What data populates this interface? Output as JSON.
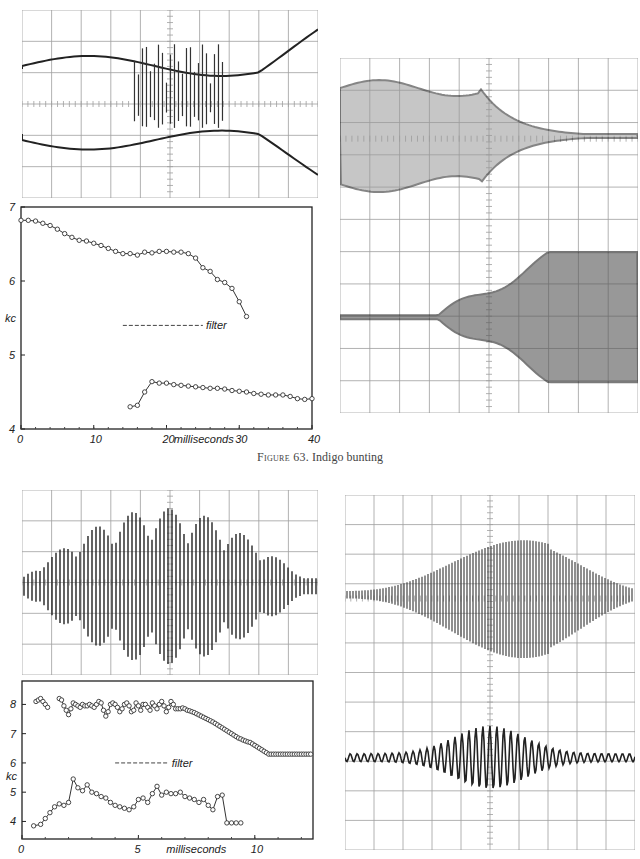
{
  "figure": {
    "caption_label": "Figure 63.",
    "caption_text": " Indigo bunting"
  },
  "oscillograms": [
    {
      "id": "osc-top-left",
      "x": 22,
      "y": 10,
      "w": 296,
      "h": 188,
      "kind": "bowtie-spiky"
    },
    {
      "id": "osc-top-right",
      "x": 340,
      "y": 58,
      "w": 298,
      "h": 355,
      "kind": "envelope-pair"
    },
    {
      "id": "osc-bottom-left",
      "x": 22,
      "y": 490,
      "w": 296,
      "h": 185,
      "kind": "spiky-burst"
    },
    {
      "id": "osc-bottom-right",
      "x": 345,
      "y": 495,
      "w": 290,
      "h": 355,
      "kind": "sinusoid-pair"
    }
  ],
  "chart_data": [
    {
      "type": "line",
      "title": "",
      "xlabel": "milliseconds",
      "ylabel": "kc",
      "xlim": [
        0,
        40
      ],
      "ylim": [
        4,
        7
      ],
      "xticks": [
        "0",
        "10",
        "20",
        "30",
        "40"
      ],
      "yticks": [
        "4",
        "5",
        "6",
        "7"
      ],
      "grid": false,
      "annotation": "filter",
      "box": {
        "x": 21,
        "y": 207,
        "w": 291,
        "h": 222
      },
      "series": [
        {
          "name": "upper",
          "x": [
            0,
            1,
            2,
            3,
            4,
            5,
            6,
            7,
            8,
            9,
            10,
            11,
            12,
            13,
            14,
            15,
            16,
            17,
            18,
            19,
            20,
            21,
            22,
            23,
            24,
            25,
            26,
            27,
            28,
            29,
            30,
            31
          ],
          "y": [
            6.82,
            6.82,
            6.81,
            6.78,
            6.75,
            6.7,
            6.64,
            6.59,
            6.55,
            6.54,
            6.51,
            6.48,
            6.44,
            6.4,
            6.37,
            6.37,
            6.35,
            6.39,
            6.38,
            6.4,
            6.4,
            6.39,
            6.39,
            6.37,
            6.31,
            6.18,
            6.13,
            6.02,
            5.98,
            5.9,
            5.72,
            5.52
          ]
        },
        {
          "name": "lower",
          "x": [
            15,
            16,
            17,
            18,
            19,
            20,
            21,
            22,
            23,
            24,
            25,
            26,
            27,
            28,
            29,
            30,
            31,
            32,
            33,
            34,
            35,
            36,
            37,
            38,
            39,
            40
          ],
          "y": [
            4.3,
            4.32,
            4.5,
            4.64,
            4.62,
            4.62,
            4.6,
            4.59,
            4.58,
            4.57,
            4.56,
            4.55,
            4.55,
            4.54,
            4.52,
            4.51,
            4.5,
            4.48,
            4.47,
            4.46,
            4.46,
            4.46,
            4.44,
            4.41,
            4.4,
            4.41
          ]
        }
      ]
    },
    {
      "type": "line",
      "title": "",
      "xlabel": "milliseconds",
      "ylabel": "kc",
      "xlim": [
        0,
        12.5
      ],
      "ylim": [
        3.4,
        8.8
      ],
      "xticks": [
        "0",
        "5",
        "10"
      ],
      "yticks": [
        "4",
        "5",
        "6",
        "7",
        "8"
      ],
      "grid": false,
      "annotation": "filter",
      "box": {
        "x": 22,
        "y": 681,
        "w": 291,
        "h": 158
      },
      "series": [
        {
          "name": "upper-a",
          "x": [
            0.6,
            0.7,
            0.8,
            0.9,
            1.0,
            1.1
          ],
          "y": [
            8.1,
            8.15,
            8.2,
            8.1,
            8.0,
            7.9
          ]
        },
        {
          "name": "upper-b",
          "x": [
            1.6,
            1.7,
            1.8,
            1.9,
            2.0,
            2.1,
            2.2,
            2.3,
            2.4,
            2.5,
            2.6,
            2.7,
            2.8,
            2.9,
            3.0,
            3.1,
            3.2,
            3.3,
            3.4,
            3.5,
            3.6,
            3.7,
            3.8,
            3.9,
            4.0,
            4.1,
            4.2,
            4.3,
            4.4,
            4.5,
            4.6,
            4.7,
            4.8,
            4.9,
            5.0,
            5.1,
            5.2,
            5.3,
            5.4,
            5.5,
            5.6,
            5.7,
            5.8,
            5.9,
            6.0,
            6.1,
            6.2,
            6.3,
            6.4,
            6.5,
            6.6,
            6.7,
            6.8,
            6.9,
            7.0,
            7.1,
            7.2,
            7.3,
            7.4,
            7.5,
            7.6,
            7.7,
            7.8,
            7.9,
            8.0,
            8.1,
            8.2,
            8.3,
            8.4,
            8.5,
            8.6,
            8.7,
            8.8,
            8.9,
            9.0,
            9.1,
            9.2,
            9.3,
            9.4,
            9.5,
            9.6,
            9.7,
            9.8,
            9.9,
            10.0,
            10.1,
            10.2,
            10.3,
            10.4,
            10.5,
            10.6,
            10.7,
            10.8,
            10.9,
            11.0,
            11.1,
            11.2,
            11.3,
            11.4,
            11.5,
            11.6,
            11.7,
            11.8,
            11.9,
            12.0,
            12.1,
            12.2,
            12.3,
            12.4
          ],
          "y": [
            8.2,
            8.15,
            7.95,
            7.8,
            7.65,
            7.85,
            8.05,
            8.0,
            7.95,
            7.9,
            8.0,
            7.95,
            7.95,
            8.0,
            7.95,
            7.9,
            8.0,
            8.1,
            8.05,
            7.8,
            7.6,
            7.75,
            8.0,
            8.05,
            8.0,
            7.9,
            7.75,
            7.85,
            8.0,
            8.05,
            7.95,
            7.75,
            7.8,
            8.05,
            7.95,
            7.8,
            8.0,
            8.0,
            7.9,
            7.8,
            8.05,
            7.95,
            7.85,
            8.0,
            8.1,
            7.95,
            7.75,
            7.9,
            8.1,
            8.0,
            7.85,
            7.85,
            7.85,
            7.88,
            7.85,
            7.8,
            7.78,
            7.75,
            7.72,
            7.68,
            7.64,
            7.6,
            7.56,
            7.52,
            7.48,
            7.44,
            7.4,
            7.35,
            7.3,
            7.25,
            7.2,
            7.15,
            7.1,
            7.05,
            7.0,
            6.95,
            6.9,
            6.85,
            6.82,
            6.78,
            6.75,
            6.72,
            6.7,
            6.65,
            6.6,
            6.55,
            6.5,
            6.45,
            6.4,
            6.35,
            6.3,
            6.3,
            6.3,
            6.3,
            6.3,
            6.3,
            6.3,
            6.3,
            6.3,
            6.3,
            6.3,
            6.3,
            6.3,
            6.3,
            6.3,
            6.3,
            6.3,
            6.3,
            6.3
          ]
        },
        {
          "name": "lower",
          "x": [
            0.5,
            0.8,
            1.0,
            1.2,
            1.4,
            1.6,
            1.8,
            2.0,
            2.2,
            2.4,
            2.6,
            2.8,
            3.0,
            3.2,
            3.4,
            3.6,
            3.8,
            4.0,
            4.2,
            4.4,
            4.6,
            4.8,
            5.0,
            5.2,
            5.4,
            5.6,
            5.8,
            6.0,
            6.2,
            6.4,
            6.6,
            6.8,
            7.0,
            7.2,
            7.4,
            7.6,
            7.8,
            8.0,
            8.2,
            8.4,
            8.6,
            8.8,
            9.0,
            9.2,
            9.4
          ],
          "y": [
            3.85,
            3.9,
            4.1,
            4.3,
            4.5,
            4.6,
            4.55,
            4.65,
            5.45,
            5.15,
            5.05,
            5.25,
            5.0,
            4.95,
            4.85,
            4.8,
            4.65,
            4.55,
            4.5,
            4.45,
            4.4,
            4.5,
            4.75,
            4.8,
            4.65,
            4.95,
            5.2,
            4.9,
            5.0,
            4.95,
            4.95,
            5.0,
            4.85,
            4.8,
            4.75,
            4.65,
            4.75,
            4.55,
            4.4,
            4.85,
            4.9,
            3.95,
            3.95,
            3.95,
            3.95
          ]
        }
      ]
    }
  ]
}
